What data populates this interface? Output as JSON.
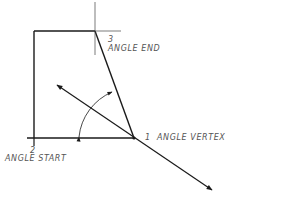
{
  "diagram": {
    "type": "angular dimension construction",
    "colors": {
      "line": "#1a1a1a",
      "thin_line": "#444444",
      "text": "#555555",
      "background": "#ffffff"
    },
    "points": [
      {
        "number": "1",
        "label": "ANGLE VERTEX",
        "x": 134,
        "y": 138
      },
      {
        "number": "2",
        "label": "ANGLE START",
        "x": 34,
        "y": 138
      },
      {
        "number": "3",
        "label": "ANGLE END",
        "x": 95,
        "y": 31
      }
    ],
    "labels": {
      "vertex_number": "1",
      "vertex_text": "ANGLE VERTEX",
      "start_number": "2",
      "start_text": "ANGLE START",
      "end_number": "3",
      "end_text": "ANGLE END"
    }
  }
}
